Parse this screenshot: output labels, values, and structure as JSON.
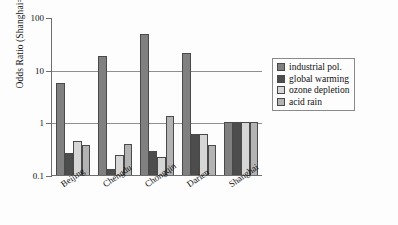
{
  "chart_data": {
    "type": "bar",
    "title": "",
    "xlabel": "",
    "ylabel": "Odds Ratio (Shanghai=1.0)",
    "yscale": "log",
    "ylim": [
      0.1,
      100
    ],
    "ytick_labels": [
      "100",
      "10",
      "1",
      "0.1"
    ],
    "ytick_values": [
      100,
      10,
      1,
      0.1
    ],
    "grid": true,
    "gridlines_at": [
      10,
      1
    ],
    "legend_position": "right",
    "categories": [
      "Beijing",
      "Chengdu",
      "Chongqin",
      "Darien",
      "Shanghai"
    ],
    "series": [
      {
        "name": "industrial pol.",
        "color": "#808080",
        "values": [
          5.5,
          18.0,
          48.0,
          21.0,
          1.0
        ]
      },
      {
        "name": "global warming",
        "color": "#4d4d4d",
        "values": [
          0.26,
          0.13,
          0.28,
          0.6,
          1.0
        ]
      },
      {
        "name": "ozone depletion",
        "color": "#d6d6d6",
        "values": [
          0.45,
          0.24,
          0.22,
          0.59,
          1.0
        ]
      },
      {
        "name": "acid rain",
        "color": "#b3b3b3",
        "values": [
          0.37,
          0.38,
          1.3,
          0.37,
          1.0
        ]
      }
    ]
  },
  "axis": {
    "y_title": "Odds Ratio (Shanghai=1.0)"
  }
}
